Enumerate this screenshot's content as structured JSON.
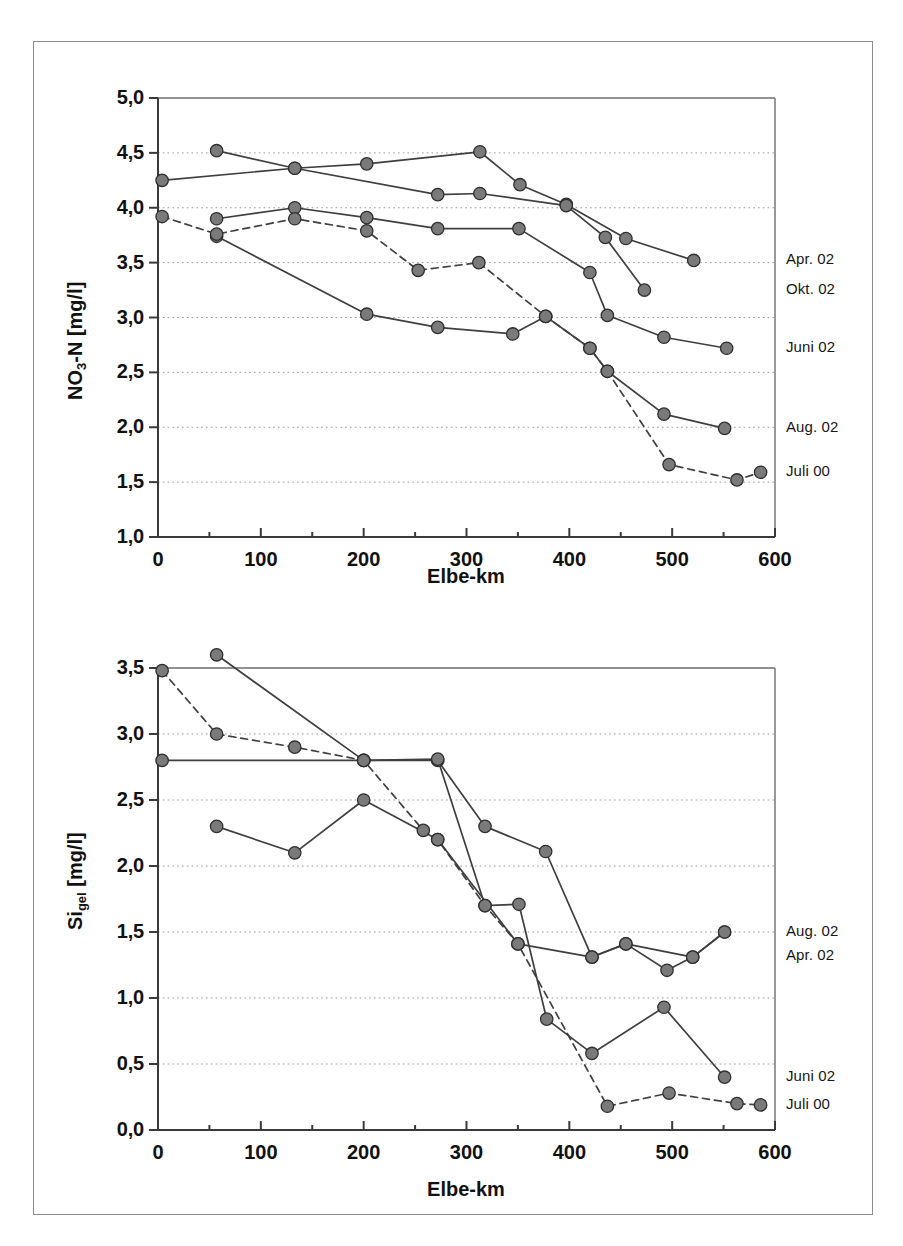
{
  "figure": {
    "background": "#ffffff",
    "frame_color": "#8c8c8c",
    "marker_fill": "#7a7a7a",
    "marker_stroke": "#2f2f2f",
    "line_color": "#3f3f3f"
  },
  "charts": [
    {
      "id": "no3n",
      "xlabel": "Elbe-km",
      "ylabel_html": "NO<sub>3</sub>-N [mg/l]",
      "ylabel_text": "NO3-N [mg/l]",
      "xticks": [
        "0",
        "100",
        "200",
        "300",
        "400",
        "500",
        "600"
      ],
      "yticks": [
        "1,0",
        "1,5",
        "2,0",
        "2,5",
        "3,0",
        "3,5",
        "4,0",
        "4,5",
        "5,0"
      ],
      "series_labels": [
        {
          "label": "Apr. 02",
          "value": 3.52
        },
        {
          "label": "Okt. 02",
          "value": 3.25
        },
        {
          "label": "Juni 02",
          "value": 2.72
        },
        {
          "label": "Aug. 02",
          "value": 1.99
        },
        {
          "label": "Juli 00",
          "value": 1.59
        }
      ]
    },
    {
      "id": "sigel",
      "xlabel": "Elbe-km",
      "ylabel_html": "Si<sub>gel</sub> [mg/l]",
      "ylabel_text": "Si gel [mg/l]",
      "xticks": [
        "0",
        "100",
        "200",
        "300",
        "400",
        "500",
        "600"
      ],
      "yticks": [
        "0,0",
        "0,5",
        "1,0",
        "1,5",
        "2,0",
        "2,5",
        "3,0",
        "3,5"
      ],
      "series_labels": [
        {
          "label": "Aug. 02",
          "value": 1.5
        },
        {
          "label": "Apr. 02",
          "value": 1.32
        },
        {
          "label": "Juni 02",
          "value": 0.4
        },
        {
          "label": "Juli 00",
          "value": 0.19
        }
      ]
    }
  ],
  "chart_data": [
    {
      "type": "line",
      "title": "",
      "xlabel": "Elbe-km",
      "ylabel": "NO3-N [mg/l]",
      "xlim": [
        0,
        600
      ],
      "ylim": [
        1.0,
        5.0
      ],
      "xticks": [
        0,
        100,
        200,
        300,
        400,
        500,
        600
      ],
      "yticks": [
        1.0,
        1.5,
        2.0,
        2.5,
        3.0,
        3.5,
        4.0,
        4.5,
        5.0
      ],
      "grid": "horizontal-dotted",
      "legend": "right-edge-labels",
      "series": [
        {
          "name": "Apr. 02",
          "style": "solid",
          "points": [
            [
              4,
              4.25
            ],
            [
              133,
              4.36
            ],
            [
              203,
              4.4
            ],
            [
              313,
              4.51
            ],
            [
              352,
              4.21
            ],
            [
              397,
              4.03
            ],
            [
              455,
              3.72
            ],
            [
              521,
              3.52
            ]
          ]
        },
        {
          "name": "Okt. 02",
          "style": "solid",
          "points": [
            [
              57,
              4.52
            ],
            [
              133,
              4.36
            ],
            [
              272,
              4.12
            ],
            [
              313,
              4.13
            ],
            [
              397,
              4.02
            ],
            [
              435,
              3.73
            ],
            [
              473,
              3.25
            ]
          ]
        },
        {
          "name": "Juni 02",
          "style": "solid",
          "points": [
            [
              57,
              3.9
            ],
            [
              133,
              4.0
            ],
            [
              203,
              3.91
            ],
            [
              272,
              3.81
            ],
            [
              351,
              3.81
            ],
            [
              420,
              3.41
            ],
            [
              437,
              3.02
            ],
            [
              492,
              2.82
            ],
            [
              553,
              2.72
            ]
          ]
        },
        {
          "name": "Aug. 02",
          "style": "solid",
          "points": [
            [
              57,
              3.74
            ],
            [
              203,
              3.03
            ],
            [
              272,
              2.91
            ],
            [
              345,
              2.85
            ],
            [
              377,
              3.01
            ],
            [
              420,
              2.72
            ],
            [
              437,
              2.51
            ],
            [
              492,
              2.12
            ],
            [
              551,
              1.99
            ]
          ]
        },
        {
          "name": "Juli 00",
          "style": "dashed",
          "points": [
            [
              4,
              3.92
            ],
            [
              57,
              3.76
            ],
            [
              133,
              3.9
            ],
            [
              203,
              3.79
            ],
            [
              253,
              3.43
            ],
            [
              312,
              3.5
            ],
            [
              377,
              3.01
            ],
            [
              420,
              2.72
            ],
            [
              437,
              2.51
            ],
            [
              497,
              1.66
            ],
            [
              563,
              1.52
            ],
            [
              586,
              1.59
            ]
          ]
        }
      ]
    },
    {
      "type": "line",
      "title": "",
      "xlabel": "Elbe-km",
      "ylabel": "Si gel [mg/l]",
      "xlim": [
        0,
        600
      ],
      "ylim": [
        0.0,
        3.5
      ],
      "xticks": [
        0,
        100,
        200,
        300,
        400,
        500,
        600
      ],
      "yticks": [
        0.0,
        0.5,
        1.0,
        1.5,
        2.0,
        2.5,
        3.0,
        3.5
      ],
      "grid": "horizontal-dotted",
      "legend": "right-edge-labels",
      "series": [
        {
          "name": "Aug. 02",
          "style": "solid",
          "points": [
            [
              57,
              3.6
            ],
            [
              200,
              2.8
            ],
            [
              272,
              2.8
            ],
            [
              318,
              2.3
            ],
            [
              377,
              2.11
            ],
            [
              422,
              1.31
            ],
            [
              455,
              1.41
            ],
            [
              495,
              1.21
            ],
            [
              520,
              1.31
            ],
            [
              551,
              1.5
            ]
          ]
        },
        {
          "name": "Apr. 02",
          "style": "solid",
          "points": [
            [
              4,
              2.8
            ],
            [
              200,
              2.8
            ],
            [
              272,
              2.81
            ],
            [
              318,
              1.7
            ],
            [
              351,
              1.71
            ],
            [
              378,
              0.84
            ],
            [
              422,
              0.58
            ],
            [
              492,
              0.93
            ],
            [
              551,
              0.4
            ]
          ]
        },
        {
          "name": "Juni 02",
          "style": "solid",
          "points": [
            [
              57,
              2.3
            ],
            [
              133,
              2.1
            ],
            [
              200,
              2.5
            ],
            [
              272,
              2.2
            ],
            [
              350,
              1.41
            ],
            [
              422,
              1.31
            ],
            [
              455,
              1.41
            ],
            [
              520,
              1.31
            ],
            [
              551,
              1.5
            ]
          ]
        },
        {
          "name": "Juli 00",
          "style": "dashed",
          "points": [
            [
              4,
              3.48
            ],
            [
              57,
              3.0
            ],
            [
              133,
              2.9
            ],
            [
              200,
              2.8
            ],
            [
              258,
              2.27
            ],
            [
              272,
              2.2
            ],
            [
              318,
              1.7
            ],
            [
              350,
              1.41
            ],
            [
              437,
              0.18
            ],
            [
              497,
              0.28
            ],
            [
              563,
              0.2
            ],
            [
              586,
              0.19
            ]
          ]
        }
      ]
    }
  ]
}
